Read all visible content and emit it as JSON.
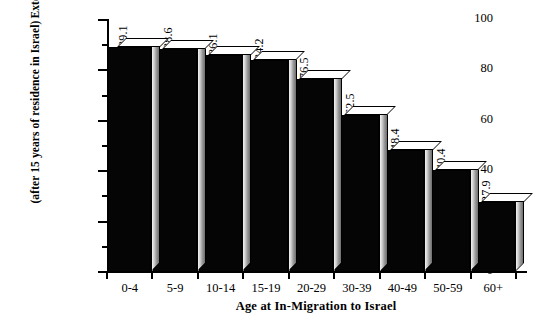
{
  "chart_data": {
    "type": "bar",
    "title": "",
    "xlabel": "Age at In-Migration to Israel",
    "ylabel_line1": "Extent of Use of Hebrew",
    "ylabel_line2": "(after 15 years of residence in Israel)",
    "categories": [
      "0-4",
      "5-9",
      "10-14",
      "15-19",
      "20-29",
      "30-39",
      "40-49",
      "50-59",
      "60+"
    ],
    "values": [
      89.1,
      88.6,
      86.1,
      84.2,
      76.5,
      62.5,
      48.4,
      40.4,
      27.9
    ],
    "value_labels": [
      "89.1",
      "88.6",
      "86.1",
      "84.2",
      "76.5",
      "62.5",
      "48.4",
      "40.4",
      "27.9"
    ],
    "ylim": [
      0,
      100
    ],
    "ytick_labels": [
      "0",
      "20",
      "40",
      "60",
      "80",
      "100"
    ],
    "ytick_values": [
      0,
      20,
      40,
      60,
      80,
      100
    ],
    "yminor_values": [
      10,
      30,
      50,
      70,
      90
    ],
    "grid": false,
    "legend": "none",
    "bar_face_color": "#050505",
    "bar_top_color": "#ffffff",
    "bar_side_color": "#9a9a9a",
    "axis_color": "#000000",
    "background_color": "#ffffff",
    "value_label_rotation": "-90",
    "style": "3d-bar"
  }
}
